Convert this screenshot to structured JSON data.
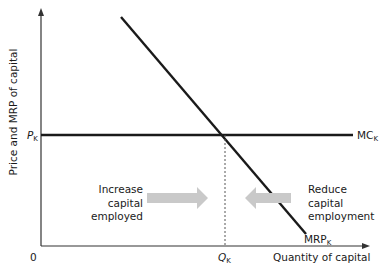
{
  "diagram": {
    "title": "",
    "y_axis_label": "Price and MRP of capital",
    "x_axis_label": "Quantity of capital",
    "origin_label": "0",
    "price_label": "P",
    "price_sub": "K",
    "quantity_label": "Q",
    "quantity_sub": "K",
    "mc_label": "MC",
    "mc_sub": "K",
    "mrp_label": "MRP",
    "mrp_sub": "K",
    "left_text": [
      "Increase",
      "capital",
      "employed"
    ],
    "right_text": [
      "Reduce",
      "capital",
      "employment"
    ],
    "colors": {
      "line": "#1a1a1a",
      "arrow": "#c9c9c9",
      "dashed": "#555555"
    }
  }
}
